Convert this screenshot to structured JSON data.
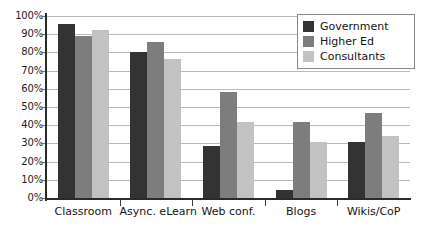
{
  "chart_data": {
    "type": "bar",
    "title": "",
    "subtitle": "",
    "xlabel": "",
    "ylabel": "",
    "ylim": [
      0,
      100
    ],
    "ytick_labels": [
      "100%",
      "90%",
      "80%",
      "70%",
      "60%",
      "50%",
      "40%",
      "30%",
      "20%",
      "10%",
      "0%"
    ],
    "ytick_values": [
      100,
      90,
      80,
      70,
      60,
      50,
      40,
      30,
      20,
      10,
      0
    ],
    "grid": "horizontal",
    "legend_position": "top-right",
    "categories": [
      "Classroom",
      "Async. eLearn",
      "Web conf.",
      "Blogs",
      "Wikis/CoP"
    ],
    "series": [
      {
        "name": "Government",
        "color": "#333333",
        "values": [
          95.5,
          80.5,
          28.5,
          4.5,
          31.0
        ]
      },
      {
        "name": "Higher Ed",
        "color": "#7d7d7d",
        "values": [
          89.0,
          85.5,
          58.0,
          41.5,
          46.5
        ]
      },
      {
        "name": "Consultants",
        "color": "#c2c2c2",
        "values": [
          92.5,
          76.5,
          42.0,
          31.0,
          34.0
        ]
      }
    ]
  },
  "legend": {
    "items": [
      {
        "label": "Government",
        "swatch": "s0"
      },
      {
        "label": "Higher Ed",
        "swatch": "s1"
      },
      {
        "label": "Consultants",
        "swatch": "s2"
      }
    ]
  },
  "axes": {
    "y_ticks": [
      "100%",
      "90%",
      "80%",
      "70%",
      "60%",
      "50%",
      "40%",
      "30%",
      "20%",
      "10%",
      "0%"
    ],
    "x_ticks": [
      "Classroom",
      "Async. eLearn",
      "Web conf.",
      "Blogs",
      "Wikis/CoP"
    ]
  }
}
